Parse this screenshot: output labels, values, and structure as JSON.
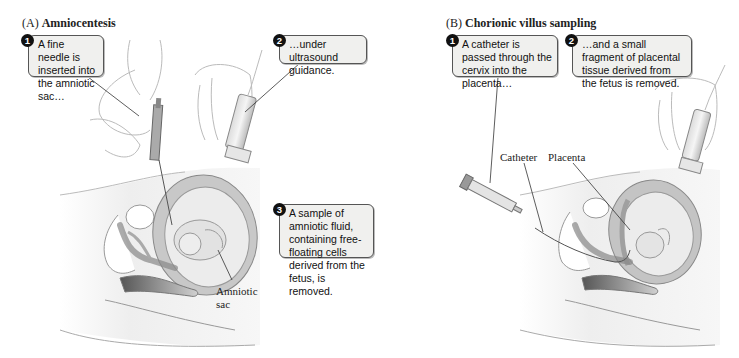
{
  "panels": [
    {
      "id": "A",
      "letter": "(A)",
      "title": "Amniocentesis",
      "callouts": [
        {
          "num": "1",
          "text": "A fine needle is inserted into the amniotic sac…"
        },
        {
          "num": "2",
          "text": "…under ultrasound guidance."
        },
        {
          "num": "3",
          "text": "A sample of amniotic fluid, containing free-floating cells derived from the fetus, is removed."
        }
      ],
      "labels": [
        {
          "text": "Amniotic"
        },
        {
          "text": "sac"
        }
      ]
    },
    {
      "id": "B",
      "letter": "(B)",
      "title": "Chorionic villus sampling",
      "callouts": [
        {
          "num": "1",
          "text": "A catheter is passed through the cervix into the placenta…"
        },
        {
          "num": "2",
          "text": "…and a small fragment of placental tissue derived from the fetus is removed."
        }
      ],
      "labels": [
        {
          "text": "Catheter"
        },
        {
          "text": "Placenta"
        }
      ]
    }
  ],
  "colors": {
    "callout_bg": "#f0f0ee",
    "callout_border": "#555555",
    "tissue_gray": "#bdbdbd",
    "skin_light": "#ececec",
    "line": "#777777"
  }
}
